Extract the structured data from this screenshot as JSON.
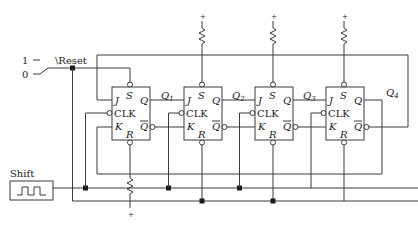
{
  "diagram": {
    "type": "4-bit JK flip-flop shift register (ring counter)",
    "switch": {
      "label": "\\Reset",
      "pos1": "1",
      "pos0": "0"
    },
    "clock": {
      "label": "Shift"
    },
    "supply": "+",
    "flipflops": [
      {
        "j": "J",
        "clk": "CLK",
        "k": "K",
        "s": "S",
        "r": "R",
        "q": "Q",
        "qbar": "Q",
        "output": "Q",
        "sub": "1"
      },
      {
        "j": "J",
        "clk": "CLK",
        "k": "K",
        "s": "S",
        "r": "R",
        "q": "Q",
        "qbar": "Q",
        "output": "Q",
        "sub": "2"
      },
      {
        "j": "J",
        "clk": "CLK",
        "k": "K",
        "s": "S",
        "r": "R",
        "q": "Q",
        "qbar": "Q",
        "output": "Q",
        "sub": "3"
      },
      {
        "j": "J",
        "clk": "CLK",
        "k": "K",
        "s": "S",
        "r": "R",
        "q": "Q",
        "qbar": "Q",
        "output": "Q",
        "sub": "4"
      }
    ]
  }
}
